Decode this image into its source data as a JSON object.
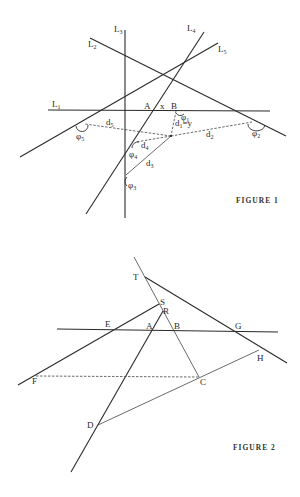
{
  "figure1": {
    "caption": "FIGURE 1",
    "lines": [
      {
        "id": "L1",
        "label": "L",
        "sub": "1"
      },
      {
        "id": "L2",
        "label": "L",
        "sub": "2"
      },
      {
        "id": "L3",
        "label": "L",
        "sub": "3"
      },
      {
        "id": "L4",
        "label": "L",
        "sub": "4"
      },
      {
        "id": "L5",
        "label": "L",
        "sub": "5"
      }
    ],
    "points": {
      "A": "A",
      "B": "B"
    },
    "segment_x": "x",
    "distances": {
      "d1": {
        "label": "d",
        "sub": "1",
        "suffix": "=y"
      },
      "d2": {
        "label": "d",
        "sub": "2"
      },
      "d3": {
        "label": "d",
        "sub": "3"
      },
      "d4": {
        "label": "d",
        "sub": "4"
      },
      "d5": {
        "label": "d",
        "sub": "5"
      }
    },
    "angles": {
      "phi1": {
        "label": "φ",
        "sub": "1"
      },
      "phi2": {
        "label": "φ",
        "sub": "2"
      },
      "phi3": {
        "label": "φ",
        "sub": "3"
      },
      "phi4": {
        "label": "φ",
        "sub": "4"
      },
      "phi5": {
        "label": "φ",
        "sub": "5"
      }
    }
  },
  "figure2": {
    "caption": "FIGURE 2",
    "points": {
      "T": "T",
      "S": "S",
      "R": "R",
      "E": "E",
      "A": "A",
      "B": "B",
      "G": "G",
      "H": "H",
      "F": "F",
      "C": "C",
      "D": "D"
    }
  }
}
